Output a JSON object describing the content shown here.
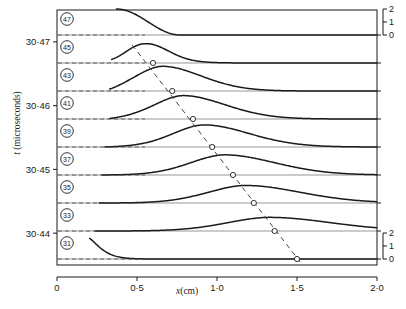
{
  "figure": {
    "kind": "stacked-waterfall-trace-plot",
    "background": "#ffffff",
    "ink": "#1a1a1a",
    "baseline_color": "#555555",
    "dash_color": "#444444"
  },
  "axes": {
    "y": {
      "label": "t (microseconds)",
      "label_symbol": "t",
      "label_unit": "(microseconds)",
      "ticks": [
        "30·47",
        "30·46",
        "30·45",
        "30·44"
      ],
      "tick_values": [
        30.47,
        30.46,
        30.45,
        30.44
      ],
      "range": [
        30.435,
        30.475
      ]
    },
    "x": {
      "label": "x (cm)",
      "label_symbol": "x",
      "label_unit": "(cm)",
      "ticks": [
        "0",
        "0·5",
        "1·0",
        "1·5",
        "2·0"
      ],
      "tick_values": [
        0,
        0.5,
        1.0,
        1.5,
        2.0
      ],
      "range": [
        0,
        2.0
      ]
    },
    "right_scale_top": {
      "labels": [
        "2",
        "1",
        "0"
      ],
      "values": [
        2,
        1,
        0
      ]
    },
    "right_scale_bottom": {
      "labels": [
        "2",
        "1",
        "0"
      ],
      "values": [
        2,
        1,
        0
      ]
    }
  },
  "chart_data": {
    "type": "line",
    "title": "",
    "xlabel": "x (cm)",
    "ylabel": "t (microseconds)",
    "xlim": [
      0,
      2.0
    ],
    "ylim": [
      30.435,
      30.475
    ],
    "grid": false,
    "legend": "none",
    "trace_labels": [
      "47",
      "45",
      "43",
      "41",
      "39",
      "37",
      "35",
      "33",
      "31"
    ],
    "series": [
      {
        "name": "47",
        "label": "47",
        "baseline_y": 35,
        "peak_x": 0.3,
        "peak_amp": 2.0,
        "width": 0.3,
        "kind": "descending-edge",
        "start_x": 0.37,
        "marker_x": null
      },
      {
        "name": "45",
        "label": "45",
        "baseline_y": 63,
        "peak_x": 0.52,
        "peak_amp": 1.95,
        "width": 0.26,
        "kind": "plateau-peak",
        "start_x": 0.34,
        "marker_x": 0.6
      },
      {
        "name": "43",
        "label": "43",
        "baseline_y": 91,
        "peak_x": 0.66,
        "peak_amp": 1.9,
        "width": 0.24,
        "kind": "peak",
        "start_x": 0.33,
        "marker_x": 0.72
      },
      {
        "name": "41",
        "label": "41",
        "baseline_y": 119,
        "peak_x": 0.79,
        "peak_amp": 1.8,
        "width": 0.26,
        "kind": "peak",
        "start_x": 0.33,
        "marker_x": 0.85
      },
      {
        "name": "39",
        "label": "39",
        "baseline_y": 147,
        "peak_x": 0.92,
        "peak_amp": 1.7,
        "width": 0.28,
        "kind": "peak",
        "start_x": 0.3,
        "marker_x": 0.97
      },
      {
        "name": "37",
        "label": "37",
        "baseline_y": 175,
        "peak_x": 1.05,
        "peak_amp": 1.55,
        "width": 0.31,
        "kind": "peak",
        "start_x": 0.28,
        "marker_x": 1.1
      },
      {
        "name": "35",
        "label": "35",
        "baseline_y": 203,
        "peak_x": 1.18,
        "peak_amp": 1.35,
        "width": 0.34,
        "kind": "peak",
        "start_x": 0.26,
        "marker_x": 1.23
      },
      {
        "name": "33",
        "label": "33",
        "baseline_y": 231,
        "peak_x": 1.33,
        "peak_amp": 1.05,
        "width": 0.38,
        "kind": "peak",
        "start_x": 0.24,
        "marker_x": 1.36
      },
      {
        "name": "31",
        "label": "31",
        "baseline_y": 259,
        "peak_x": 0.24,
        "peak_amp": 1.6,
        "width": 0.1,
        "kind": "steep-decay",
        "start_x": 0.2,
        "marker_x": 1.5
      }
    ],
    "trajectory": {
      "style": "dashed",
      "x_start": 0.47,
      "y_start_px": 45,
      "x_end": 1.52,
      "y_end_px": 262,
      "markers": "open-circle"
    }
  },
  "geometry": {
    "plot_left_px": 57,
    "plot_right_px": 377,
    "plot_top_px": 10,
    "plot_bottom_px": 265,
    "x_axis_line_y_px": 277
  }
}
